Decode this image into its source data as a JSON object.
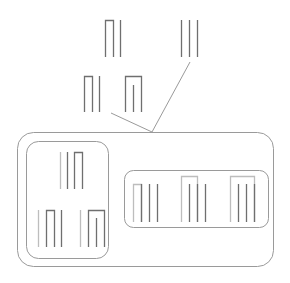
{
  "diagram": {
    "width": 290,
    "height": 283,
    "stroke_dark": "#6f6f6f",
    "stroke_light": "#bdbdbd",
    "stroke_frame": "#9a9a9a",
    "containers": [
      {
        "id": "outer-container",
        "x": 17,
        "y": 132,
        "w": 256,
        "h": 134,
        "r": 16
      },
      {
        "id": "left-inner-container",
        "x": 26,
        "y": 141,
        "w": 82,
        "h": 117,
        "r": 12
      },
      {
        "id": "right-inner-container",
        "x": 124,
        "y": 170,
        "w": 144,
        "h": 57,
        "r": 9
      }
    ],
    "connectors": [
      {
        "id": "connector-left",
        "x1": 111,
        "y1": 113,
        "x2": 152,
        "y2": 132
      },
      {
        "id": "connector-right",
        "x1": 190,
        "y1": 62,
        "x2": 152,
        "y2": 132
      }
    ],
    "glyphs": [
      {
        "id": "glyph-top-left",
        "strokes": [
          {
            "type": "arch",
            "x1": 105,
            "x2": 113,
            "ytop": 20,
            "ybot": 57,
            "tone": "dark"
          },
          {
            "type": "line",
            "x": 120,
            "y1": 20,
            "y2": 57,
            "tone": "dark"
          }
        ]
      },
      {
        "id": "glyph-top-right",
        "strokes": [
          {
            "type": "line",
            "x": 181,
            "y1": 20,
            "y2": 57,
            "tone": "dark"
          },
          {
            "type": "line",
            "x": 189,
            "y1": 20,
            "y2": 57,
            "tone": "dark"
          },
          {
            "type": "line",
            "x": 197,
            "y1": 20,
            "y2": 57,
            "tone": "dark"
          }
        ]
      },
      {
        "id": "glyph-mid-left",
        "strokes": [
          {
            "type": "arch",
            "x1": 84,
            "x2": 92,
            "ytop": 76,
            "ybot": 112,
            "tone": "dark"
          },
          {
            "type": "line",
            "x": 99,
            "y1": 76,
            "y2": 112,
            "tone": "dark"
          }
        ]
      },
      {
        "id": "glyph-mid-right",
        "strokes": [
          {
            "type": "arch",
            "x1": 125,
            "x2": 141,
            "ytop": 76,
            "ybot": 112,
            "tone": "dark"
          },
          {
            "type": "line",
            "x": 133,
            "y1": 85,
            "y2": 112,
            "tone": "dark"
          }
        ]
      },
      {
        "id": "glyph-left-box-top",
        "strokes": [
          {
            "type": "line",
            "x": 60,
            "y1": 152,
            "y2": 189,
            "tone": "light"
          },
          {
            "type": "line",
            "x": 67,
            "y1": 152,
            "y2": 189,
            "tone": "dark"
          },
          {
            "type": "arch",
            "x1": 74,
            "x2": 82,
            "ytop": 152,
            "ybot": 189,
            "tone": "dark"
          }
        ]
      },
      {
        "id": "glyph-left-box-bottom-left",
        "strokes": [
          {
            "type": "line",
            "x": 38,
            "y1": 210,
            "y2": 247,
            "tone": "light"
          },
          {
            "type": "arch",
            "x1": 46,
            "x2": 54,
            "ytop": 210,
            "ybot": 247,
            "tone": "dark"
          },
          {
            "type": "line",
            "x": 61,
            "y1": 210,
            "y2": 247,
            "tone": "dark"
          }
        ]
      },
      {
        "id": "glyph-left-box-bottom-right",
        "strokes": [
          {
            "type": "line",
            "x": 80,
            "y1": 210,
            "y2": 247,
            "tone": "light"
          },
          {
            "type": "arch",
            "x1": 88,
            "x2": 104,
            "ytop": 210,
            "ybot": 247,
            "tone": "dark"
          },
          {
            "type": "line",
            "x": 96,
            "y1": 218,
            "y2": 247,
            "tone": "dark"
          }
        ]
      },
      {
        "id": "glyph-right-box-1",
        "strokes": [
          {
            "type": "arch",
            "x1": 133,
            "x2": 141,
            "ytop": 184,
            "ybot": 222,
            "tone": "light"
          },
          {
            "type": "line",
            "x": 141,
            "y1": 184,
            "y2": 222,
            "tone": "dark"
          },
          {
            "type": "line",
            "x": 149,
            "y1": 184,
            "y2": 222,
            "tone": "dark"
          },
          {
            "type": "line",
            "x": 157,
            "y1": 184,
            "y2": 222,
            "tone": "dark"
          }
        ]
      },
      {
        "id": "glyph-right-box-2",
        "strokes": [
          {
            "type": "arch",
            "x1": 181,
            "x2": 197,
            "ytop": 176,
            "ybot": 222,
            "tone": "light"
          },
          {
            "type": "line",
            "x": 189,
            "y1": 184,
            "y2": 222,
            "tone": "dark"
          },
          {
            "type": "line",
            "x": 197,
            "y1": 184,
            "y2": 222,
            "tone": "dark"
          },
          {
            "type": "line",
            "x": 205,
            "y1": 184,
            "y2": 222,
            "tone": "dark"
          }
        ]
      },
      {
        "id": "glyph-right-box-3",
        "strokes": [
          {
            "type": "arch",
            "x1": 230,
            "x2": 254,
            "ytop": 176,
            "ybot": 222,
            "tone": "light"
          },
          {
            "type": "line",
            "x": 238,
            "y1": 184,
            "y2": 222,
            "tone": "dark"
          },
          {
            "type": "line",
            "x": 246,
            "y1": 184,
            "y2": 222,
            "tone": "dark"
          },
          {
            "type": "line",
            "x": 254,
            "y1": 184,
            "y2": 222,
            "tone": "dark"
          }
        ]
      }
    ]
  }
}
